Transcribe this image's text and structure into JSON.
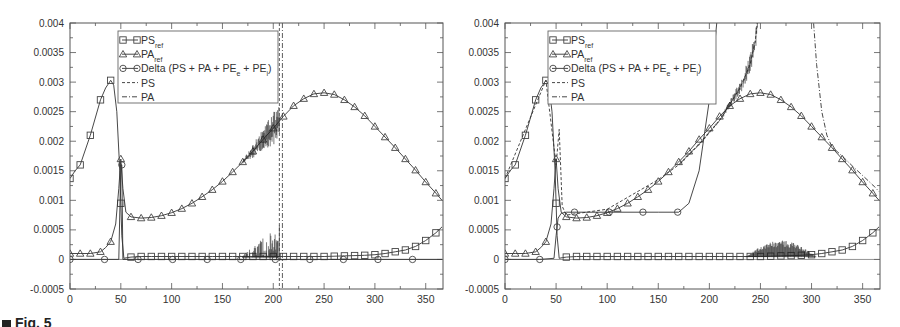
{
  "figure_caption": "Fig. 5",
  "chart_data": [
    {
      "type": "line",
      "panel": "left",
      "title": "",
      "xlabel": "",
      "ylabel": "",
      "xlim": [
        0,
        367
      ],
      "ylim": [
        -0.0005,
        0.004
      ],
      "xticks": [
        0,
        50,
        100,
        150,
        200,
        250,
        300,
        350
      ],
      "yticks": [
        -0.0005,
        0,
        0.0005,
        0.001,
        0.0015,
        0.002,
        0.0025,
        0.003,
        0.0035,
        0.004
      ],
      "ytick_labels": [
        "-0.0005",
        "0",
        "0.0005",
        "0.001",
        "0.0015",
        "0.002",
        "0.0025",
        "0.003",
        "0.0035",
        "0.004"
      ],
      "grid": false,
      "legend_position": "upper-left-inset",
      "legend": [
        {
          "label": "PS",
          "sub": "ref",
          "style": "solid-square"
        },
        {
          "label": "PA",
          "sub": "ref",
          "style": "solid-triangle"
        },
        {
          "label": "Delta (PS + PA + PE",
          "sub": "e",
          "label2": " + PE",
          "sub2": "i",
          "tail": ")",
          "style": "solid-circle"
        },
        {
          "label": "PS",
          "sub": "",
          "style": "dashed"
        },
        {
          "label": "PA",
          "sub": "",
          "style": "dash-dot"
        }
      ],
      "series": [
        {
          "name": "PS_ref",
          "marker": "square",
          "x": [
            0,
            5,
            10,
            20,
            30,
            35,
            40,
            43,
            46,
            49,
            51,
            53,
            56,
            60,
            70,
            80,
            100,
            120,
            140,
            160,
            180,
            200,
            210,
            230,
            250,
            270,
            290,
            300,
            310,
            320,
            330,
            340,
            350,
            360,
            366
          ],
          "y": [
            0.00137,
            0.0015,
            0.0016,
            0.0021,
            0.0027,
            0.0029,
            0.00303,
            0.00295,
            0.0025,
            0.0015,
            0.0004,
            2e-05,
            3e-05,
            4e-05,
            5e-05,
            5e-05,
            5e-05,
            5e-05,
            5e-05,
            5e-05,
            5e-05,
            5e-05,
            5e-05,
            5e-05,
            5e-05,
            6e-05,
            7e-05,
            8e-05,
            0.0001,
            0.00013,
            0.00016,
            0.00022,
            0.00032,
            0.00045,
            0.00055
          ],
          "marker_x": [
            0,
            10,
            20,
            30,
            40,
            50,
            60,
            70,
            80,
            90,
            100,
            110,
            120,
            130,
            140,
            150,
            160,
            170,
            180,
            190,
            200,
            210,
            220,
            230,
            240,
            250,
            260,
            270,
            280,
            290,
            300,
            310,
            320,
            330,
            340,
            350,
            360
          ]
        },
        {
          "name": "PA_ref",
          "marker": "triangle",
          "x": [
            0,
            10,
            20,
            30,
            35,
            40,
            45,
            48,
            50,
            52,
            55,
            60,
            70,
            80,
            90,
            100,
            110,
            120,
            130,
            140,
            150,
            160,
            170,
            180,
            190,
            200,
            210,
            220,
            230,
            240,
            250,
            260,
            270,
            280,
            290,
            300,
            310,
            320,
            330,
            340,
            350,
            360,
            366
          ],
          "y": [
            0.0001,
            0.0001,
            0.0001,
            0.00013,
            0.0002,
            0.0003,
            0.0006,
            0.0012,
            0.0017,
            0.0012,
            0.0008,
            0.00072,
            0.0007,
            0.00071,
            0.00074,
            0.00079,
            0.00086,
            0.00095,
            0.00106,
            0.00118,
            0.00132,
            0.00148,
            0.00165,
            0.00183,
            0.00203,
            0.00222,
            0.00242,
            0.0026,
            0.00272,
            0.0028,
            0.00282,
            0.00279,
            0.0027,
            0.00258,
            0.00243,
            0.00225,
            0.00207,
            0.00189,
            0.0017,
            0.00151,
            0.00131,
            0.00112,
            0.001
          ],
          "marker_x": [
            0,
            10,
            20,
            30,
            40,
            50,
            60,
            70,
            80,
            90,
            100,
            110,
            120,
            130,
            140,
            150,
            160,
            170,
            180,
            190,
            200,
            210,
            220,
            230,
            240,
            250,
            260,
            270,
            280,
            290,
            300,
            310,
            320,
            330,
            340,
            350,
            360
          ]
        },
        {
          "name": "Delta (PS + PA + PE_e + PE_i)",
          "marker": "circle",
          "x": [
            0,
            30,
            48,
            50,
            51,
            52,
            60,
            100,
            200,
            208,
            250,
            300,
            366
          ],
          "y": [
            0,
            0,
            0,
            0.0016,
            0.0016,
            0,
            0,
            0,
            0,
            0,
            0,
            0,
            0
          ],
          "marker_x": [
            0,
            34,
            51,
            67,
            101,
            135,
            168,
            202,
            236,
            269,
            303,
            337
          ]
        },
        {
          "name": "PS",
          "style": "dashed",
          "note": "follows PS_ref, noisy 170-205, vertical at ~208",
          "diverges_at_x": 208
        },
        {
          "name": "PA",
          "style": "dash-dot",
          "note": "follows PA_ref, noisy 170-205, vertical at ~208",
          "diverges_at_x": 208
        }
      ]
    },
    {
      "type": "line",
      "panel": "right",
      "title": "",
      "xlabel": "",
      "ylabel": "",
      "xlim": [
        0,
        367
      ],
      "ylim": [
        -0.0005,
        0.004
      ],
      "xticks": [
        0,
        50,
        100,
        150,
        200,
        250,
        300,
        350
      ],
      "yticks": [
        -0.0005,
        0,
        0.0005,
        0.001,
        0.0015,
        0.002,
        0.0025,
        0.003,
        0.0035,
        0.004
      ],
      "ytick_labels": [
        "-0.0005",
        "0",
        "0.0005",
        "0.001",
        "0.0015",
        "0.002",
        "0.0025",
        "0.003",
        "0.0035",
        "0.004"
      ],
      "grid": false,
      "legend_position": "upper-left-inset",
      "legend": [
        {
          "label": "PS",
          "sub": "ref",
          "style": "solid-square"
        },
        {
          "label": "PA",
          "sub": "ref",
          "style": "solid-triangle"
        },
        {
          "label": "Delta (PS + PA + PE",
          "sub": "e",
          "label2": " + PE",
          "sub2": "i",
          "tail": ")",
          "style": "solid-circle"
        },
        {
          "label": "PS",
          "sub": "",
          "style": "dashed"
        },
        {
          "label": "PA",
          "sub": "",
          "style": "dash-dot"
        }
      ],
      "series": [
        {
          "name": "PS_ref",
          "marker": "square",
          "x": [
            0,
            5,
            10,
            20,
            30,
            35,
            40,
            43,
            46,
            49,
            51,
            53,
            56,
            60,
            70,
            80,
            100,
            120,
            140,
            160,
            180,
            200,
            210,
            230,
            250,
            270,
            290,
            300,
            310,
            320,
            330,
            340,
            350,
            360,
            366
          ],
          "y": [
            0.00137,
            0.0015,
            0.0016,
            0.0021,
            0.0027,
            0.0029,
            0.00303,
            0.00295,
            0.0025,
            0.0015,
            0.0004,
            2e-05,
            3e-05,
            4e-05,
            5e-05,
            5e-05,
            5e-05,
            5e-05,
            5e-05,
            5e-05,
            5e-05,
            5e-05,
            5e-05,
            5e-05,
            5e-05,
            6e-05,
            7e-05,
            8e-05,
            0.0001,
            0.00013,
            0.00016,
            0.00022,
            0.00032,
            0.00045,
            0.00055
          ],
          "marker_x": [
            0,
            10,
            20,
            30,
            40,
            50,
            60,
            70,
            80,
            90,
            100,
            110,
            120,
            130,
            140,
            150,
            160,
            170,
            180,
            190,
            200,
            210,
            220,
            230,
            240,
            250,
            260,
            270,
            280,
            290,
            300,
            310,
            320,
            330,
            340,
            350,
            360
          ]
        },
        {
          "name": "PA_ref",
          "marker": "triangle",
          "x": [
            0,
            10,
            20,
            30,
            35,
            40,
            45,
            48,
            50,
            52,
            55,
            60,
            70,
            80,
            90,
            100,
            110,
            120,
            130,
            140,
            150,
            160,
            170,
            180,
            190,
            200,
            210,
            220,
            230,
            240,
            250,
            260,
            270,
            280,
            290,
            300,
            310,
            320,
            330,
            340,
            350,
            360,
            366
          ],
          "y": [
            0.0001,
            0.0001,
            0.0001,
            0.00013,
            0.0002,
            0.0003,
            0.0006,
            0.0012,
            0.0017,
            0.0012,
            0.0008,
            0.00072,
            0.0007,
            0.00071,
            0.00074,
            0.00079,
            0.00086,
            0.00095,
            0.00106,
            0.00118,
            0.00132,
            0.00148,
            0.00165,
            0.00183,
            0.00203,
            0.00222,
            0.00242,
            0.0026,
            0.00272,
            0.0028,
            0.00282,
            0.00279,
            0.0027,
            0.00258,
            0.00243,
            0.00225,
            0.00207,
            0.00189,
            0.0017,
            0.00151,
            0.00131,
            0.00112,
            0.001
          ],
          "marker_x": [
            0,
            10,
            20,
            30,
            40,
            50,
            60,
            70,
            80,
            90,
            100,
            110,
            120,
            130,
            140,
            150,
            160,
            170,
            180,
            190,
            200,
            210,
            220,
            230,
            240,
            250,
            260,
            270,
            280,
            290,
            300,
            310,
            320,
            330,
            340,
            350,
            360
          ]
        },
        {
          "name": "Delta (PS + PA + PE_e + PE_i)",
          "marker": "circle",
          "x": [
            0,
            34,
            48,
            50,
            52,
            55,
            60,
            100,
            150,
            170,
            180,
            190,
            200,
            205,
            210
          ],
          "y": [
            0,
            0,
            2e-05,
            0.0004,
            0.0007,
            0.00078,
            0.0008,
            0.0008,
            0.0008,
            0.0008,
            0.00095,
            0.0015,
            0.0027,
            0.0036,
            0.0045
          ],
          "marker_x": [
            0,
            34,
            51,
            68,
            102,
            135,
            169
          ]
        },
        {
          "name": "PS",
          "style": "dashed",
          "x": [
            0,
            40,
            50,
            53,
            56,
            60,
            100,
            150,
            170,
            190,
            210,
            230,
            240,
            245,
            250
          ],
          "y": [
            0.00137,
            0.00303,
            0.0016,
            0.0022,
            0.0009,
            0.00075,
            0.00085,
            0.00135,
            0.0016,
            0.00195,
            0.00235,
            0.0029,
            0.0033,
            0.0037,
            0.0045
          ]
        },
        {
          "name": "PA",
          "style": "dash-dot",
          "x": [
            300,
            302,
            305,
            310,
            315,
            320,
            330,
            340,
            350,
            360,
            366
          ],
          "y": [
            0.0045,
            0.004,
            0.0033,
            0.0025,
            0.0021,
            0.0019,
            0.00175,
            0.00158,
            0.00142,
            0.00126,
            0.00115
          ]
        }
      ]
    }
  ]
}
